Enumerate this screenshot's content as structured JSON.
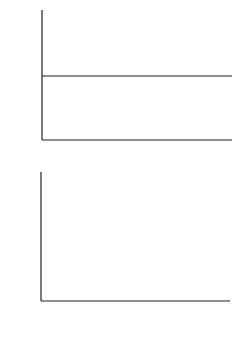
{
  "chart_data": [
    {
      "type": "line",
      "title": "",
      "xlabel": "tc_s/r_n",
      "ylabel": "φ1(t)",
      "xlim": [
        216,
        316
      ],
      "ylim": [
        -120,
        120
      ],
      "xticks": [
        216,
        236,
        256,
        276,
        296,
        316
      ],
      "yticks": [
        80,
        0,
        -80
      ],
      "grid": false,
      "zero_line": true,
      "series": [
        {
          "name": "phi1",
          "style": "solid",
          "x": [
            216,
            217,
            218,
            219,
            220,
            221,
            222,
            223,
            224,
            225,
            226,
            227,
            228,
            229,
            230,
            231,
            232,
            233,
            234,
            235,
            236,
            237,
            238,
            239,
            240,
            241,
            242,
            243,
            244,
            245,
            246,
            247,
            248,
            249,
            250,
            251,
            252,
            253,
            254,
            255,
            256,
            257,
            258,
            259,
            260,
            261,
            262,
            263,
            264,
            265,
            266,
            267,
            268,
            269,
            270,
            271,
            272,
            273,
            274,
            275,
            276,
            277,
            278,
            279,
            280,
            281,
            282,
            283,
            284,
            285,
            286,
            287,
            288,
            289,
            290,
            291,
            292,
            293,
            294,
            295,
            296,
            297,
            298,
            299,
            300,
            301,
            302,
            303,
            304,
            305,
            306,
            307,
            308,
            309,
            310,
            311,
            312,
            313,
            314,
            315,
            316
          ],
          "y": [
            -20,
            -50,
            -55,
            -20,
            20,
            33,
            10,
            -30,
            -38,
            -10,
            40,
            70,
            74,
            40,
            0,
            -5,
            50,
            85,
            92,
            50,
            -10,
            -50,
            -20,
            10,
            -30,
            -88,
            -60,
            30,
            82,
            60,
            15,
            70,
            50,
            10,
            68,
            40,
            -20,
            -70,
            -75,
            -45,
            -5,
            -40,
            -60,
            -82,
            -50,
            20,
            75,
            80,
            40,
            -10,
            -50,
            -75,
            -80,
            -40,
            10,
            60,
            100,
            60,
            -10,
            -85,
            -80,
            -20,
            -5,
            -60,
            -78,
            -40,
            20,
            65,
            50,
            -40,
            -70,
            -80
          ],
          "note": "irregular oscillation, envelope decays toward t≈316; values traced approximately"
        },
        {
          "name": "dotted-segments",
          "style": "dotted",
          "segments": [
            {
              "x": [
                266,
                268
              ],
              "y": [
                80,
                -88
              ]
            },
            {
              "x": [
                269,
                270
              ],
              "y": [
                -40,
                5
              ]
            },
            {
              "x": [
                291,
                292
              ],
              "y": [
                -20,
                25
              ]
            },
            {
              "x": [
                293,
                294
              ],
              "y": [
                30,
                -10
              ]
            }
          ]
        }
      ]
    },
    {
      "type": "bar",
      "title": "",
      "xlabel": "ωr_n/c_s",
      "ylabel": "|φ1(ω)|",
      "xlim": [
        0,
        3
      ],
      "ylim": [
        0,
        100
      ],
      "xticks": [
        0,
        1,
        2,
        3
      ],
      "yticks_unlabeled": [
        25,
        50,
        75
      ],
      "grid": false,
      "x": [
        0.06,
        0.12,
        0.17,
        0.23,
        0.29,
        0.37,
        0.43,
        0.48,
        0.54,
        0.6,
        0.66,
        0.71,
        0.77,
        0.83,
        0.89,
        0.95,
        1.02,
        1.08,
        1.14,
        1.2,
        1.26,
        1.31,
        1.37,
        1.43,
        1.49,
        1.54,
        1.6,
        1.66,
        1.72,
        1.78,
        1.84,
        1.89,
        1.95,
        2.01,
        2.07,
        2.13,
        2.19,
        2.25,
        2.31,
        2.37,
        2.43,
        2.49,
        2.55,
        2.61,
        2.67
      ],
      "values": [
        11,
        24,
        21,
        29,
        4,
        87,
        62,
        34,
        37,
        8,
        29,
        21,
        31,
        18,
        71,
        9,
        28,
        17,
        15,
        72,
        47,
        20,
        6,
        28,
        46,
        18,
        36,
        11,
        51,
        42,
        9,
        10,
        13,
        16,
        3,
        7,
        3,
        5,
        7,
        12,
        4,
        6,
        5,
        2,
        7
      ]
    }
  ],
  "labels": {
    "top": {
      "ylabel": "φ",
      "ylabel_sub": "1",
      "ylabel_arg": "(t)",
      "xlabel_main": "tc",
      "xlabel_sub1": "s",
      "xlabel_slash": "/r",
      "xlabel_sub2": "n",
      "xticks": [
        "216",
        "236",
        "256",
        "276",
        "296",
        "316"
      ],
      "yticks": [
        "80",
        "0",
        "-80"
      ]
    },
    "bottom": {
      "ylabel": "|φ",
      "ylabel_sub": "1",
      "ylabel_arg": "(ω)|",
      "xlabel_main": "ωr",
      "xlabel_sub1": "n",
      "xlabel_slash": "/c",
      "xlabel_sub2": "s",
      "xticks": [
        "0",
        "1",
        "2",
        "3"
      ]
    }
  }
}
